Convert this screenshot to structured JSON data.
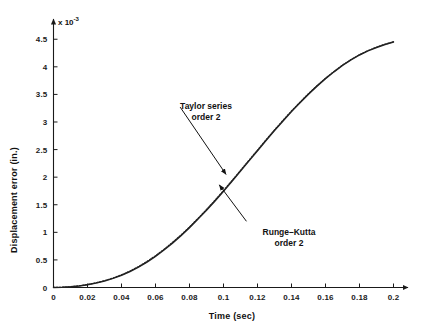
{
  "chart_data": {
    "type": "line",
    "title": "",
    "xlabel": "Time (sec)",
    "ylabel": "Displacement error (in.)",
    "y_multiplier_text": "x 10",
    "y_multiplier_exponent": "-3",
    "y_scale": 0.001,
    "xlim": [
      0,
      0.2
    ],
    "ylim": [
      0,
      4.75
    ],
    "grid": false,
    "legend_position": "none",
    "xticks": [
      0,
      0.02,
      0.04,
      0.06,
      0.08,
      0.1,
      0.12,
      0.14,
      0.16,
      0.18,
      0.2
    ],
    "xtick_labels": [
      "0",
      "0.02",
      "0.04",
      "0.06",
      "0.08",
      "0.1",
      "0.12",
      "0.14",
      "0.16",
      "0.18",
      "0.2"
    ],
    "yticks": [
      0,
      0.5,
      1,
      1.5,
      2,
      2.5,
      3,
      3.5,
      4,
      4.5
    ],
    "ytick_labels": [
      "0",
      "0.5",
      "1",
      "1.5",
      "2",
      "2.5",
      "3",
      "3.5",
      "4",
      "4.5"
    ],
    "annotations": [
      {
        "name": "taylor-series",
        "line1": "Taylor series",
        "line2": "order 2",
        "arrow_from": [
          0.0745,
          3.27
        ],
        "arrow_to": [
          0.1015,
          2.05
        ]
      },
      {
        "name": "runge-kutta",
        "line1": "Runge–Kutta",
        "line2": "order 2",
        "arrow_from": [
          0.1135,
          1.2
        ],
        "arrow_to": [
          0.0975,
          1.86
        ]
      }
    ],
    "series": [
      {
        "name": "Taylor series order 2",
        "color": "#222222",
        "x": [
          0,
          0.005,
          0.01,
          0.015,
          0.02,
          0.025,
          0.03,
          0.035,
          0.04,
          0.045,
          0.05,
          0.055,
          0.06,
          0.065,
          0.07,
          0.075,
          0.08,
          0.085,
          0.09,
          0.095,
          0.1,
          0.105,
          0.11,
          0.115,
          0.12,
          0.125,
          0.13,
          0.135,
          0.14,
          0.145,
          0.15,
          0.155,
          0.16,
          0.165,
          0.17,
          0.175,
          0.18,
          0.185,
          0.19,
          0.195,
          0.2
        ],
        "values": [
          0.0,
          0.003,
          0.012,
          0.028,
          0.05,
          0.08,
          0.118,
          0.165,
          0.222,
          0.29,
          0.37,
          0.462,
          0.565,
          0.68,
          0.805,
          0.94,
          1.085,
          1.24,
          1.4,
          1.57,
          1.745,
          1.925,
          2.11,
          2.295,
          2.48,
          2.665,
          2.845,
          3.02,
          3.19,
          3.35,
          3.505,
          3.65,
          3.785,
          3.91,
          4.025,
          4.125,
          4.215,
          4.29,
          4.35,
          4.405,
          4.45
        ]
      },
      {
        "name": "Runge-Kutta order 2",
        "color": "#222222",
        "x": [
          0,
          0.005,
          0.01,
          0.015,
          0.02,
          0.025,
          0.03,
          0.035,
          0.04,
          0.045,
          0.05,
          0.055,
          0.06,
          0.065,
          0.07,
          0.075,
          0.08,
          0.085,
          0.09,
          0.095,
          0.1,
          0.105,
          0.11,
          0.115,
          0.12,
          0.125,
          0.13,
          0.135,
          0.14,
          0.145,
          0.15,
          0.155,
          0.16,
          0.165,
          0.17,
          0.175,
          0.18,
          0.185,
          0.19,
          0.195,
          0.2
        ],
        "values": [
          0.0,
          0.0035,
          0.013,
          0.03,
          0.053,
          0.084,
          0.123,
          0.171,
          0.229,
          0.298,
          0.379,
          0.472,
          0.576,
          0.692,
          0.818,
          0.953,
          1.098,
          1.253,
          1.414,
          1.583,
          1.758,
          1.938,
          2.123,
          2.308,
          2.492,
          2.676,
          2.856,
          3.031,
          3.2,
          3.36,
          3.514,
          3.658,
          3.793,
          3.917,
          4.031,
          4.131,
          4.22,
          4.295,
          4.355,
          4.41,
          4.455
        ]
      }
    ]
  },
  "axes": {
    "x_arrow": true,
    "y_arrow": true,
    "spine_color": "#1a1a1a"
  }
}
